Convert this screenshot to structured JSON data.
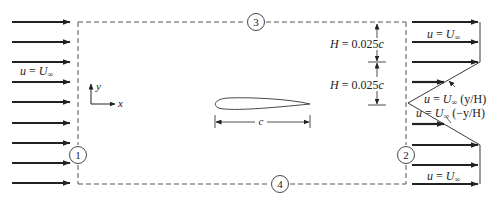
{
  "figure": {
    "control_volume": {
      "boundaries": [
        {
          "id": "1",
          "label": "1",
          "side": "left"
        },
        {
          "id": "2",
          "label": "2",
          "side": "right"
        },
        {
          "id": "3",
          "label": "3",
          "side": "top"
        },
        {
          "id": "4",
          "label": "4",
          "side": "bottom"
        }
      ]
    },
    "inflow": {
      "label_u": "u",
      "label_eq": " = ",
      "label_U": "U",
      "label_sub": "∞",
      "arrow_count": 9
    },
    "axes": {
      "x_label": "x",
      "y_label": "y"
    },
    "airfoil": {
      "chord_label": "c"
    },
    "dimensions": {
      "upper": {
        "H": "H",
        "eq": " = 0.025",
        "c": "c"
      },
      "lower": {
        "H": "H",
        "eq": " = 0.025",
        "c": "c"
      }
    },
    "outflow": {
      "top_label": {
        "u": "u",
        "eq": " = ",
        "U": "U",
        "sub": "∞"
      },
      "bottom_label": {
        "u": "u",
        "eq": " = ",
        "U": "U",
        "sub": "∞"
      },
      "upper_wake_label": {
        "u": "u",
        "eq": " = ",
        "U": "U",
        "sub": "∞",
        "tail": " (y/H)"
      },
      "lower_wake_label": {
        "u": "u",
        "eq": " = ",
        "U": "U",
        "sub": "∞",
        "tail": " (−y/H)"
      }
    },
    "colors": {
      "line": "#222222",
      "dashed": "#555555",
      "background": "#ffffff"
    }
  }
}
